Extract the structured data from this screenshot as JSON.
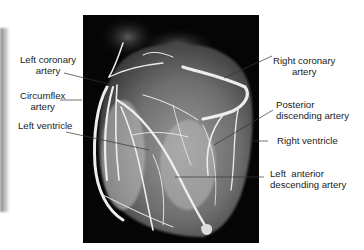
{
  "figure": {
    "labels": {
      "left_coronary_artery": {
        "line1": "Left coronary",
        "line2": "artery"
      },
      "circumflex_artery": {
        "line1": "Circumflex",
        "line2": "artery"
      },
      "left_ventricle": {
        "line1": "Left ventricle"
      },
      "right_coronary_artery": {
        "line1": "Right coronary",
        "line2": "artery"
      },
      "posterior_descending_artery": {
        "line1": "Posterior",
        "line2": "discending artery"
      },
      "right_ventricle": {
        "line1": "Right ventricle"
      },
      "left_anterior_descending_artery": {
        "line1": "Left  anterior",
        "line2": "descending artery"
      }
    },
    "colors": {
      "background": "#ffffff",
      "photo_background": "#050505",
      "vessel": "#e8e8e8",
      "label_text": "#222222",
      "leader_line": "#333333"
    }
  }
}
